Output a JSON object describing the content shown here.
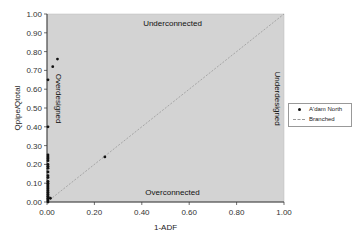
{
  "chart_data": {
    "type": "scatter",
    "title": "",
    "xlabel": "1-ADF",
    "ylabel": "Qpipe/Qtotal",
    "xlim": [
      0,
      1
    ],
    "ylim": [
      0,
      1
    ],
    "grid": false,
    "plot_background": "#d3d3d3",
    "x_ticks": [
      "0.00",
      "0.20",
      "0.40",
      "0.60",
      "0.80",
      "1.00"
    ],
    "y_ticks": [
      "0.00",
      "0.10",
      "0.20",
      "0.30",
      "0.40",
      "0.50",
      "0.60",
      "0.70",
      "0.80",
      "0.90",
      "1.00"
    ],
    "legend_position": "right",
    "annotations": {
      "top": "Underconnected",
      "bottom": "Overconnected",
      "left": "Overdesigned",
      "right": "Underdesigned"
    },
    "series": [
      {
        "name": "A'dam North",
        "marker": "dot",
        "color": "#111111",
        "points": [
          [
            0.0,
            0.0
          ],
          [
            0.0,
            0.01
          ],
          [
            0.0,
            0.02
          ],
          [
            0.0,
            0.03
          ],
          [
            0.0,
            0.04
          ],
          [
            0.0,
            0.05
          ],
          [
            0.0,
            0.06
          ],
          [
            0.0,
            0.07
          ],
          [
            0.0,
            0.08
          ],
          [
            0.0,
            0.09
          ],
          [
            0.0,
            0.1
          ],
          [
            0.0,
            0.11
          ],
          [
            0.0,
            0.13
          ],
          [
            0.0,
            0.14
          ],
          [
            0.0,
            0.16
          ],
          [
            0.0,
            0.18
          ],
          [
            0.0,
            0.19
          ],
          [
            0.0,
            0.2
          ],
          [
            0.0,
            0.22
          ],
          [
            0.0,
            0.23
          ],
          [
            0.0,
            0.24
          ],
          [
            0.0,
            0.25
          ],
          [
            0.0,
            0.4
          ],
          [
            0.0,
            0.65
          ],
          [
            0.01,
            0.02
          ],
          [
            0.02,
            0.72
          ],
          [
            0.04,
            0.76
          ],
          [
            0.24,
            0.24
          ]
        ]
      },
      {
        "name": "Branched",
        "type": "line",
        "style": "dashed",
        "color": "#999999",
        "points": [
          [
            0,
            0
          ],
          [
            1,
            1
          ]
        ]
      }
    ]
  }
}
